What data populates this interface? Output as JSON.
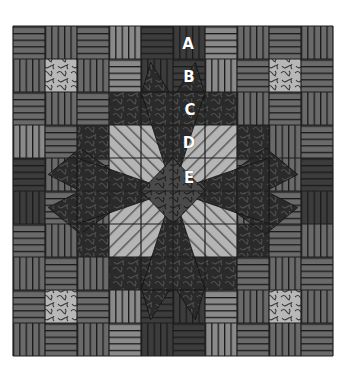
{
  "quilt": {
    "grid": {
      "x": 13,
      "y": 26,
      "cols": 10,
      "rows": 10,
      "cell_w": 32,
      "cell_h": 33
    },
    "colors": {
      "border": "#1e1e1e",
      "stripe_mid": "#6a6a6a",
      "stripe_light": "#8a8a8a",
      "stripe_dark": "#3c3c3c",
      "stripe_line": "#1a1a1a",
      "swirl_light": "#b8b8b8",
      "swirl_dark": "#2a2a2a",
      "swirl_mid": "#4a4a4a",
      "diag_light": "#b5b5b5",
      "diag_line": "#555555"
    },
    "blocks": [
      [
        "H",
        "V",
        "H",
        "VL",
        "HD",
        "VD",
        "HL",
        "V",
        "H",
        "V"
      ],
      [
        "V",
        "SL",
        "V",
        "HL",
        "VD",
        "HD",
        "VL",
        "H",
        "SL",
        "H"
      ],
      [
        "H",
        "V",
        "H",
        "SD",
        "SD",
        "SD",
        "SD",
        "V",
        "H",
        "V"
      ],
      [
        "VL",
        "H",
        "SD",
        "DL",
        "DL",
        "DL",
        "DL",
        "SD",
        "V",
        "H"
      ],
      [
        "HD",
        "V",
        "H",
        "DL",
        "DL",
        "DL",
        "DL",
        "H",
        "V",
        "HD"
      ],
      [
        "VD",
        "H",
        "V",
        "DL",
        "DL",
        "DL",
        "DL",
        "V",
        "H",
        "VD"
      ],
      [
        "H",
        "V",
        "SD",
        "DL",
        "DL",
        "DL",
        "DL",
        "SD",
        "H",
        "V"
      ],
      [
        "V",
        "H",
        "V",
        "SD",
        "SD",
        "SD",
        "SD",
        "H",
        "V",
        "H"
      ],
      [
        "H",
        "SL",
        "H",
        "VL",
        "HD",
        "VD",
        "HL",
        "V",
        "SL",
        "V"
      ],
      [
        "V",
        "H",
        "V",
        "HL",
        "VD",
        "HD",
        "VL",
        "H",
        "V",
        "H"
      ]
    ],
    "labels": [
      {
        "text": "A",
        "x": 188,
        "y": 44
      },
      {
        "text": "B",
        "x": 189,
        "y": 77
      },
      {
        "text": "C",
        "x": 190,
        "y": 110
      },
      {
        "text": "D",
        "x": 189,
        "y": 143
      },
      {
        "text": "E",
        "x": 189,
        "y": 178
      }
    ]
  }
}
